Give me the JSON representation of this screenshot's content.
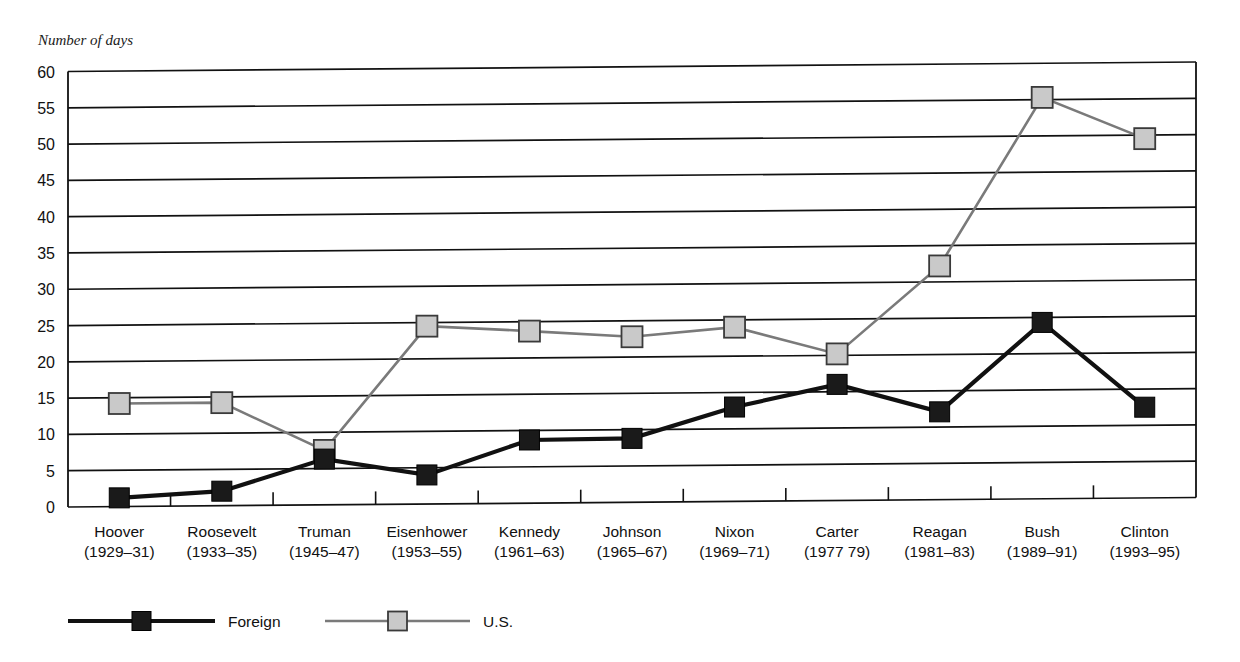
{
  "chart_data": {
    "type": "line",
    "title": "",
    "ylabel": "Number of days",
    "xlabel": "",
    "ylim": [
      0,
      60
    ],
    "yticks": [
      0,
      5,
      10,
      15,
      20,
      25,
      30,
      35,
      40,
      45,
      50,
      55,
      60
    ],
    "grid": true,
    "legend_position": "bottom-left",
    "categories": [
      "Hoover",
      "Roosevelt",
      "Truman",
      "Eisenhower",
      "Kennedy",
      "Johnson",
      "Nixon",
      "Carter",
      "Reagan",
      "Bush",
      "Clinton"
    ],
    "category_years": [
      "(1929–31)",
      "(1933–35)",
      "(1945–47)",
      "(1953–55)",
      "(1961–63)",
      "(1965–67)",
      "(1969–71)",
      "(1977 79)",
      "(1981–83)",
      "(1989–91)",
      "(1993–95)"
    ],
    "series": [
      {
        "name": "Foreign",
        "color": "#1a1a1a",
        "marker": "filled-square",
        "values": [
          1.2,
          2.0,
          6.3,
          4.0,
          8.7,
          8.8,
          13.0,
          16.0,
          12.1,
          24.3,
          12.5
        ]
      },
      {
        "name": "U.S.",
        "color": "#7a7a7a",
        "marker": "light-square",
        "values": [
          14.2,
          14.2,
          7.5,
          24.5,
          23.7,
          22.8,
          24.0,
          20.2,
          32.2,
          55.3,
          49.5
        ]
      }
    ]
  },
  "legend": {
    "items": [
      {
        "label": "Foreign"
      },
      {
        "label": "U.S."
      }
    ]
  },
  "colors": {
    "foreign": "#1a1a1a",
    "us": "#7a7a7a",
    "us_marker_fill": "#c9c9c9",
    "axis": "#111111",
    "background": "#ffffff"
  }
}
